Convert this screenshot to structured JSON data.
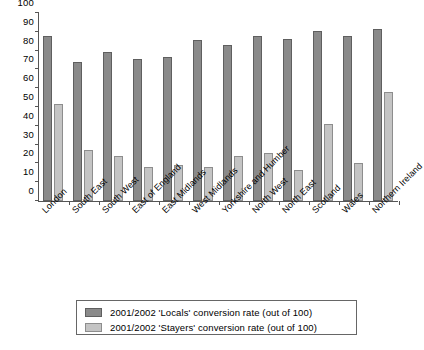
{
  "chart_data": {
    "type": "bar",
    "title": "",
    "xlabel": "",
    "ylabel": "",
    "ylim": [
      0,
      100
    ],
    "ytick_step": 10,
    "yticks": [
      0,
      10,
      20,
      30,
      40,
      50,
      60,
      70,
      80,
      90,
      100
    ],
    "grid": false,
    "legend_position": "bottom-center",
    "categories": [
      "London",
      "South East",
      "South West",
      "East of England",
      "East Midlands",
      "West Midlands",
      "Yorkshire and Humber",
      "North West",
      "North East",
      "Scotland",
      "Wales",
      "Northern Ireland"
    ],
    "series": [
      {
        "name": "2001/2002 'Locals' conversion rate (out of 100)",
        "color": "#8a8a8a",
        "values": [
          88,
          74,
          79,
          75.5,
          76.5,
          85.5,
          83,
          88,
          86,
          90.5,
          88,
          91.5
        ]
      },
      {
        "name": "2001/2002 'Stayers' conversion rate (out of 100)",
        "color": "#c4c4c4",
        "values": [
          51.5,
          27,
          24,
          18,
          19,
          18,
          24,
          25.5,
          16.5,
          41,
          20,
          58
        ]
      }
    ]
  },
  "legend": {
    "items": [
      {
        "label": "2001/2002 'Locals' conversion rate (out of 100)",
        "swatch": "locals"
      },
      {
        "label": "2001/2002 'Stayers' conversion rate (out of 100)",
        "swatch": "stayers"
      }
    ]
  }
}
